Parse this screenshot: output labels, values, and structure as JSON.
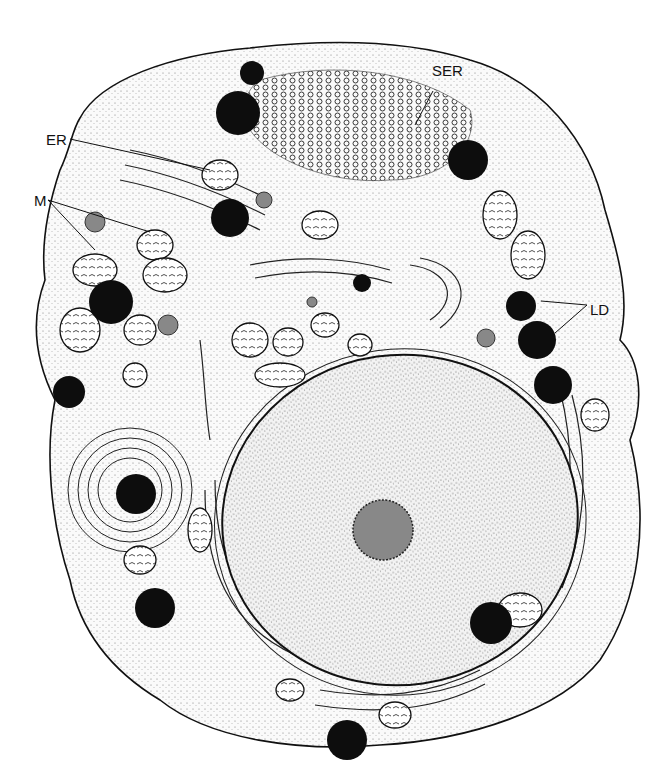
{
  "figure": {
    "labels": [
      {
        "id": "ser",
        "text": "SER",
        "x": 432,
        "y": 62
      },
      {
        "id": "er",
        "text": "ER",
        "x": 46,
        "y": 131
      },
      {
        "id": "m",
        "text": "M",
        "x": 34,
        "y": 192
      },
      {
        "id": "ld",
        "text": "LD",
        "x": 590,
        "y": 301
      }
    ],
    "colors": {
      "ink": "#111111",
      "cytoplasm": "#f4f4f4",
      "nucleus": "#ececec",
      "lipid": "#0d0d0d"
    }
  }
}
